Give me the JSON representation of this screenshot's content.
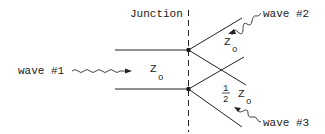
{
  "diagram": {
    "junction_label": "Junction",
    "wave1_label": "wave #1",
    "wave2_label": "wave #2",
    "wave3_label": "wave #3",
    "impedance_main": {
      "symbol": "Z",
      "subscript": "o"
    },
    "impedance_upper": {
      "symbol": "Z",
      "subscript": "o"
    },
    "impedance_lower": {
      "coefficient_num": "1",
      "coefficient_den": "2",
      "symbol": "Z",
      "subscript": "o"
    }
  }
}
